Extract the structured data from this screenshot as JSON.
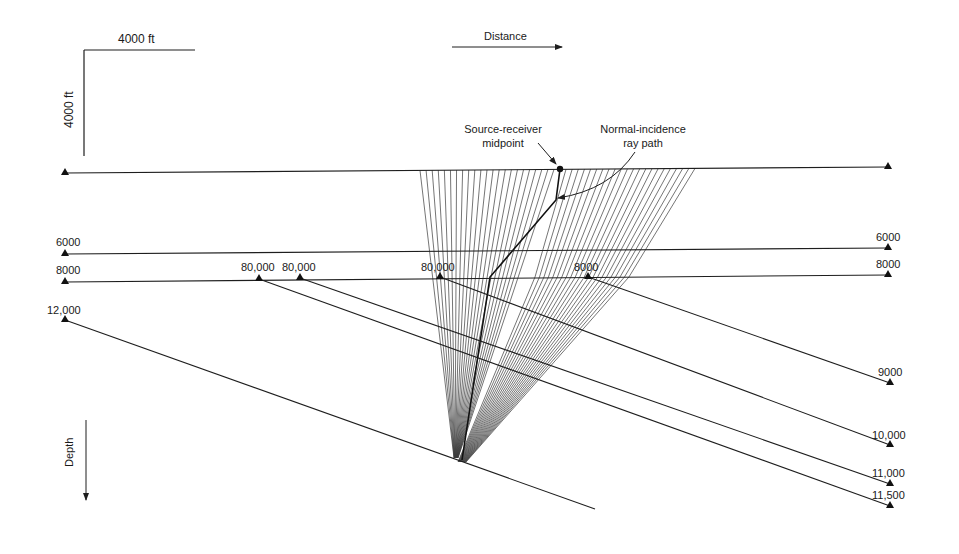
{
  "diagram": {
    "colors": {
      "ink": "#1e1e1e",
      "ray": "#3a3a3a",
      "background": "#ffffff"
    },
    "scale_bar": {
      "horizontal_label": "4000 ft",
      "vertical_label": "4000 ft"
    },
    "axes": {
      "distance_label": "Distance",
      "depth_label": "Depth"
    },
    "annotations": {
      "midpoint_line1": "Source-receiver",
      "midpoint_line2": "midpoint",
      "normal_ray_line1": "Normal-incidence",
      "normal_ray_line2": "ray path"
    },
    "surface": {
      "x1": 65,
      "y1": 173,
      "x2": 888,
      "y2": 167
    },
    "midpoint": {
      "x": 560,
      "y": 169
    },
    "focus": {
      "x": 460,
      "y": 460
    },
    "interfaces": [
      {
        "label_left": "6000",
        "label_right": "6000",
        "x1": 65,
        "y1": 254,
        "x2": 888,
        "y2": 248
      },
      {
        "label_left": "8000",
        "label_right": "8000",
        "x1": 65,
        "y1": 282,
        "x2": 888,
        "y2": 275
      },
      {
        "label_left": "12,000",
        "x1": 65,
        "y1": 320,
        "x2": 595,
        "y2": 509
      }
    ],
    "dipping_interfaces": [
      {
        "label_start": "8000",
        "label_end": "9000",
        "x1": 588,
        "y1": 277,
        "x2": 890,
        "y2": 383
      },
      {
        "label_start": "80,000",
        "label_end": "10,000",
        "x1": 440,
        "y1": 277,
        "x2": 890,
        "y2": 445
      },
      {
        "label_start": "80,000",
        "label_end": "11,000",
        "x1": 300,
        "y1": 278,
        "x2": 890,
        "y2": 484
      },
      {
        "label_start": "80,000",
        "label_end": "11,500",
        "x1": 259,
        "y1": 279,
        "x2": 890,
        "y2": 506
      }
    ],
    "ray_fan": {
      "left_start_x": 420,
      "left_end_x": 554,
      "left_count": 23,
      "right_start_x": 566,
      "right_end_x": 695,
      "right_count": 22
    }
  }
}
